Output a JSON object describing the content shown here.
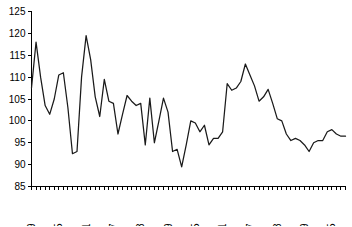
{
  "chart_data": {
    "type": "line",
    "title": "",
    "subtitle": "",
    "xlabel": "",
    "ylabel": "",
    "ylim": [
      85,
      125
    ],
    "xlim": [
      1949,
      2018
    ],
    "y_ticks": [
      85,
      90,
      95,
      100,
      105,
      110,
      115,
      120,
      125
    ],
    "x_tick_labels": [
      "1949",
      "1955",
      "1961",
      "1967",
      "1973",
      "1979",
      "1985",
      "1991",
      "1997",
      "2003",
      "2009",
      "2015"
    ],
    "x_tick_years": [
      1949,
      1955,
      1961,
      1967,
      1973,
      1979,
      1985,
      1991,
      1997,
      2003,
      2009,
      2015
    ],
    "x_tick_label_rotation": -90,
    "x_minor_tick_interval": 1,
    "grid": false,
    "legend": false,
    "legend_position": "none",
    "line_color": "#1a1a1a",
    "series": [
      {
        "name": "",
        "x": [
          1949,
          1950,
          1951,
          1952,
          1953,
          1954,
          1955,
          1956,
          1957,
          1958,
          1959,
          1960,
          1961,
          1962,
          1963,
          1964,
          1965,
          1966,
          1967,
          1968,
          1969,
          1970,
          1971,
          1972,
          1973,
          1974,
          1975,
          1976,
          1977,
          1978,
          1979,
          1980,
          1981,
          1982,
          1983,
          1984,
          1985,
          1986,
          1987,
          1988,
          1989,
          1990,
          1991,
          1992,
          1993,
          1994,
          1995,
          1996,
          1997,
          1998,
          1999,
          2000,
          2001,
          2002,
          2003,
          2004,
          2005,
          2006,
          2007,
          2008,
          2009,
          2010,
          2011,
          2012,
          2013,
          2014,
          2015,
          2016,
          2017,
          2018
        ],
        "values": [
          107.5,
          118.0,
          110.0,
          103.5,
          101.5,
          105.0,
          110.5,
          111.0,
          103.0,
          92.5,
          93.0,
          110.0,
          119.5,
          114.0,
          105.5,
          101.0,
          109.5,
          104.5,
          104.0,
          97.0,
          101.5,
          105.8,
          104.5,
          103.5,
          104.0,
          94.5,
          105.2,
          95.0,
          100.0,
          105.2,
          102.0,
          93.0,
          93.5,
          89.5,
          94.5,
          100.0,
          99.5,
          97.5,
          99.0,
          94.5,
          96.0,
          96.0,
          97.5,
          108.5,
          107.0,
          107.5,
          109.0,
          113.0,
          110.5,
          108.0,
          104.5,
          105.5,
          107.2,
          104.0,
          100.5,
          100.0,
          97.0,
          95.5,
          96.0,
          95.5,
          94.5,
          93.0,
          95.0,
          95.5,
          95.5,
          97.5,
          98.0,
          97.0,
          96.5,
          96.5
        ]
      }
    ]
  }
}
